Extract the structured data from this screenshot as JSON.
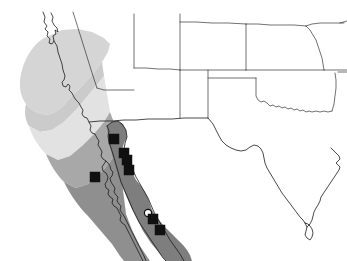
{
  "figure": {
    "width": 347,
    "height": 261,
    "background_color": "#ffffff"
  },
  "chart_data": {
    "type": "map",
    "title": "",
    "projection_region": "Southwestern United States and northwestern Mexico",
    "legend_position": "none",
    "grid": false,
    "range_bands": [
      {
        "name": "northern-coastal-range",
        "label": "Northern coastal range",
        "color": "#d5d5d5",
        "region": "Northern California coast"
      },
      {
        "name": "central-coastal-range",
        "label": "Central coastal range",
        "color": "#cbcbcb",
        "region": "Central California coast"
      },
      {
        "name": "southern-coastal-range",
        "label": "Southern coastal range",
        "color": "#e2e2e2",
        "region": "Southern California coast"
      },
      {
        "name": "baja-north-range",
        "label": "Northern Baja range",
        "color": "#a8a8a8",
        "region": "Northern Baja California"
      },
      {
        "name": "baja-south-range",
        "label": "Southern Baja range",
        "color": "#8f8f8f",
        "region": "Southern Baja California"
      },
      {
        "name": "mainland-mexico-range",
        "label": "Mainland Mexico range",
        "color": "#7e7e7e",
        "region": "Sonora and Sinaloa, mainland Mexico"
      }
    ],
    "markers": [
      {
        "id": "loc-1",
        "type": "filled-square",
        "x": 114,
        "y": 139,
        "color": "#101010"
      },
      {
        "id": "loc-2",
        "type": "filled-square",
        "x": 124,
        "y": 153,
        "color": "#101010"
      },
      {
        "id": "loc-3",
        "type": "filled-square",
        "x": 127,
        "y": 160,
        "color": "#101010"
      },
      {
        "id": "loc-4",
        "type": "filled-square",
        "x": 129,
        "y": 170,
        "color": "#101010"
      },
      {
        "id": "loc-5",
        "type": "filled-square",
        "x": 95,
        "y": 177,
        "color": "#101010"
      },
      {
        "id": "loc-6",
        "type": "open-circle",
        "x": 148,
        "y": 213,
        "color": "#ffffff"
      },
      {
        "id": "loc-7",
        "type": "filled-square",
        "x": 153,
        "y": 219,
        "color": "#101010"
      },
      {
        "id": "loc-8",
        "type": "filled-square",
        "x": 160,
        "y": 230,
        "color": "#101010"
      }
    ],
    "marker_counts": {
      "filled_squares": 7,
      "open_circles": 1
    },
    "outline_color": "#1a1a1a",
    "border_color": "#333333"
  }
}
